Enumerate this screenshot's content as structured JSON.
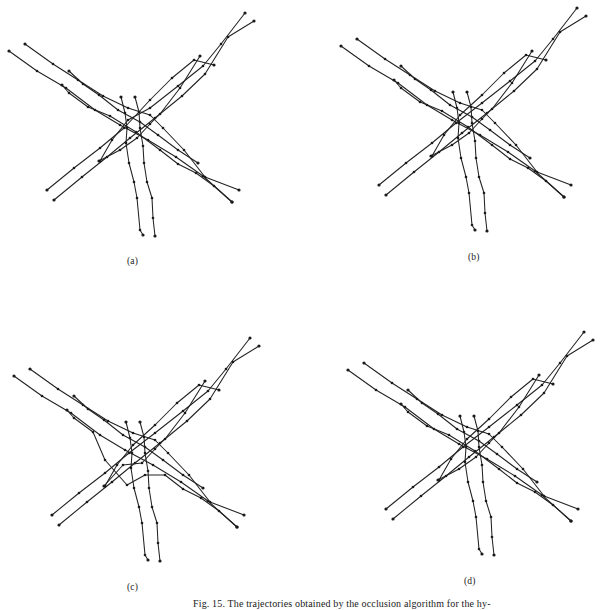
{
  "figure": {
    "caption": "Fig. 15.  The trajectories obtained by the occlusion algorithm for the hy-",
    "panels": [
      {
        "label": "(a)",
        "offset": [
          0,
          0
        ],
        "variant": "a"
      },
      {
        "label": "(b)",
        "offset": [
          332,
          -5
        ],
        "variant": "b"
      },
      {
        "label": "(c)",
        "offset": [
          5,
          325
        ],
        "variant": "c"
      },
      {
        "label": "(d)",
        "offset": [
          339,
          319
        ],
        "variant": "b"
      }
    ],
    "trajectories_base": [
      {
        "name": "NW-SE-1",
        "points": [
          [
            9,
            51
          ],
          [
            37,
            71
          ],
          [
            66,
            88
          ],
          [
            95,
            110
          ],
          [
            120,
            125
          ],
          [
            148,
            140
          ],
          [
            176,
            157
          ],
          [
            203,
            176
          ],
          [
            232,
            202
          ]
        ]
      },
      {
        "name": "NW-SE-2",
        "points": [
          [
            25,
            44
          ],
          [
            53,
            64
          ],
          [
            78,
            80
          ],
          [
            103,
            96
          ],
          [
            128,
            108
          ],
          [
            150,
            115
          ],
          [
            163,
            128
          ],
          [
            184,
            150
          ],
          [
            205,
            177
          ],
          [
            239,
            190
          ]
        ]
      },
      {
        "name": "NW-SE-3",
        "points": [
          [
            69,
            71
          ],
          [
            83,
            84
          ],
          [
            99,
            95
          ],
          [
            118,
            110
          ],
          [
            140,
            122
          ],
          [
            158,
            135
          ],
          [
            178,
            150
          ],
          [
            198,
            163
          ]
        ]
      },
      {
        "name": "NW-SE-4",
        "points": [
          [
            62,
            85
          ],
          [
            69,
            93
          ],
          [
            88,
            107
          ],
          [
            110,
            116
          ],
          [
            136,
            132
          ],
          [
            160,
            150
          ],
          [
            178,
            164
          ],
          [
            196,
            173
          ],
          [
            214,
            186
          ],
          [
            232,
            202
          ]
        ]
      },
      {
        "name": "SW-NE-1",
        "points": [
          [
            47,
            190
          ],
          [
            74,
            168
          ],
          [
            100,
            148
          ],
          [
            124,
            128
          ],
          [
            150,
            108
          ],
          [
            178,
            86
          ],
          [
            203,
            66
          ],
          [
            221,
            44
          ],
          [
            245,
            13
          ]
        ]
      },
      {
        "name": "SW-NE-2",
        "points": [
          [
            54,
            200
          ],
          [
            82,
            177
          ],
          [
            107,
            157
          ],
          [
            130,
            138
          ],
          [
            155,
            118
          ],
          [
            182,
            96
          ],
          [
            205,
            74
          ],
          [
            228,
            37
          ],
          [
            254,
            21
          ]
        ]
      },
      {
        "name": "SW-NE-3",
        "points": [
          [
            100,
            161
          ],
          [
            112,
            140
          ],
          [
            128,
            120
          ],
          [
            150,
            100
          ],
          [
            172,
            78
          ],
          [
            194,
            60
          ],
          [
            214,
            65
          ]
        ]
      },
      {
        "name": "SW-NE-4",
        "points": [
          [
            99,
            161
          ],
          [
            120,
            150
          ],
          [
            137,
            138
          ],
          [
            150,
            124
          ],
          [
            160,
            114
          ],
          [
            180,
            88
          ],
          [
            200,
            56
          ]
        ]
      },
      {
        "name": "S-1",
        "points": [
          [
            121,
            97
          ],
          [
            125,
            113
          ],
          [
            127,
            128
          ],
          [
            126,
            143
          ],
          [
            129,
            163
          ],
          [
            134,
            182
          ],
          [
            137,
            198
          ],
          [
            140,
            230
          ],
          [
            143,
            235
          ]
        ]
      },
      {
        "name": "S-2",
        "points": [
          [
            135,
            97
          ],
          [
            139,
            112
          ],
          [
            140,
            128
          ],
          [
            143,
            146
          ],
          [
            144,
            163
          ],
          [
            147,
            182
          ],
          [
            152,
            198
          ],
          [
            153,
            218
          ],
          [
            155,
            236
          ]
        ]
      }
    ],
    "panel_variations": {
      "a": "two trajectories exchanged near the crossing (occlusion error)",
      "b": "clean trajectories",
      "c": "additional cross-links at the occlusion region"
    }
  }
}
